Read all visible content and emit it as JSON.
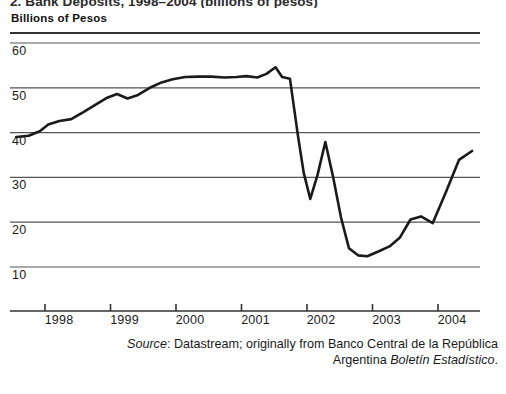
{
  "figure": {
    "title_clipped": "2. Bank Deposits, 1998–2004 (billions of pesos)",
    "axis_caption": "Billions of Pesos",
    "source_label": "Source",
    "source_line_1_rest": ": Datastream; originally from Banco Central de la República",
    "source_line_2_prefix": "Argentina ",
    "source_line_2_italic": "Boletín Estadístico",
    "source_line_2_suffix": "."
  },
  "chart_data": {
    "type": "line",
    "title": "2. Bank Deposits, 1998–2004 (billions of pesos)",
    "xlabel": "",
    "ylabel": "Billions of Pesos",
    "ylim": [
      5,
      60
    ],
    "xlim": [
      1997.5,
      2004.65
    ],
    "grid": true,
    "legend": false,
    "line_color": "#1a1a1a",
    "ytick_labels": [
      "60",
      "50",
      "40",
      "30",
      "20",
      "10"
    ],
    "ytick_values": [
      60,
      50,
      40,
      30,
      20,
      10
    ],
    "xtick_labels": [
      "1998",
      "1999",
      "2000",
      "2001",
      "2002",
      "2003",
      "2004"
    ],
    "xtick_values": [
      1998,
      1999,
      2000,
      2001,
      2002,
      2003,
      2004
    ],
    "series": [
      {
        "name": "Bank deposits",
        "x": [
          1997.56,
          1997.75,
          1997.92,
          1998.05,
          1998.22,
          1998.4,
          1998.58,
          1998.78,
          1998.95,
          1999.1,
          1999.26,
          1999.42,
          1999.6,
          1999.78,
          1999.95,
          2000.14,
          2000.34,
          2000.54,
          2000.74,
          2000.92,
          2001.08,
          2001.24,
          2001.38,
          2001.52,
          2001.62,
          2001.74,
          2001.86,
          2001.95,
          2002.05,
          2002.16,
          2002.28,
          2002.4,
          2002.52,
          2002.64,
          2002.78,
          2002.92,
          2003.08,
          2003.26,
          2003.42,
          2003.58,
          2003.74,
          2003.92,
          2004.12,
          2004.32,
          2004.52
        ],
        "y": [
          39.0,
          39.3,
          40.3,
          41.8,
          42.6,
          43.0,
          44.5,
          46.3,
          47.8,
          48.6,
          47.6,
          48.4,
          50.0,
          51.2,
          51.9,
          52.4,
          52.5,
          52.5,
          52.3,
          52.4,
          52.6,
          52.3,
          53.1,
          54.6,
          52.4,
          52.0,
          39.5,
          31.0,
          25.2,
          30.5,
          37.9,
          30.0,
          21.0,
          14.2,
          12.6,
          12.4,
          13.4,
          14.6,
          16.6,
          20.6,
          21.3,
          19.8,
          26.7,
          33.9,
          35.9
        ]
      }
    ],
    "annotations": {
      "peak_value": 54.6,
      "peak_period": "late 2001",
      "trough_value": 12.4,
      "trough_period": "late 2002",
      "start_value": 39.0,
      "end_value": 35.9
    }
  }
}
